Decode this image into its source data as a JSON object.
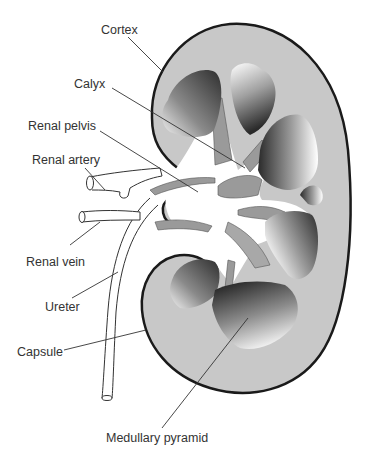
{
  "diagram": {
    "labels": {
      "cortex": "Cortex",
      "calyx": "Calyx",
      "renal_pelvis": "Renal pelvis",
      "renal_artery": "Renal artery",
      "renal_vein": "Renal vein",
      "ureter": "Ureter",
      "capsule": "Capsule",
      "medullary_pyramid": "Medullary pyramid"
    },
    "colors": {
      "cortex_fill": "#c8c8c8",
      "outline": "#1a1a1a",
      "pyramid_dark": "#3a3a3a",
      "pyramid_light": "#ffffff",
      "vessel_fill": "#9a9a9a",
      "leader_line": "#333333",
      "text": "#333333"
    }
  }
}
